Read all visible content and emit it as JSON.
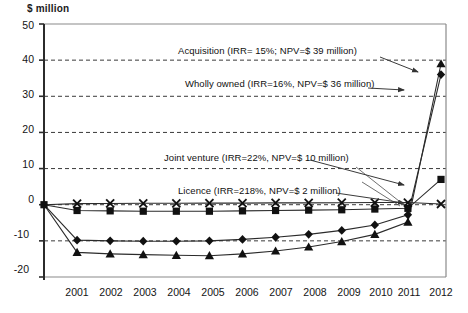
{
  "chart_data": {
    "type": "line",
    "title": "",
    "subtitle": "",
    "xlabel": "",
    "ylabel": "$ million",
    "ylim": [
      -20,
      50
    ],
    "xlim": [
      2000,
      2012
    ],
    "grid": true,
    "gridlines_y": [
      40,
      30,
      20,
      10,
      0,
      -10
    ],
    "legend_position": "inline-annotations",
    "ytick_labels": [
      "50",
      "40",
      "30",
      "20",
      "10",
      "0",
      "-10",
      "-20"
    ],
    "ytick_values": [
      50,
      40,
      30,
      20,
      10,
      0,
      -10,
      -20
    ],
    "xtick_labels": [
      "2001",
      "2002",
      "2003",
      "2004",
      "2005",
      "2006",
      "2007",
      "2008",
      "2009",
      "2010",
      "2011",
      "2012"
    ],
    "x": [
      2000,
      2001,
      2002,
      2003,
      2004,
      2005,
      2006,
      2007,
      2008,
      2009,
      2010,
      2011,
      2012
    ],
    "series": [
      {
        "name": "Acquisition",
        "marker": "triangle",
        "irr": "15%",
        "npv": "$ 39 million",
        "values": [
          0,
          -13.2,
          -13.6,
          -13.8,
          -14.0,
          -14.1,
          -13.6,
          -12.8,
          -11.7,
          -10.2,
          -8.2,
          -4.8,
          39
        ]
      },
      {
        "name": "Wholly owned",
        "marker": "diamond",
        "irr": "16%",
        "npv": "$ 36 million",
        "values": [
          0,
          -9.8,
          -10.0,
          -10.1,
          -10.1,
          -10.0,
          -9.6,
          -9.0,
          -8.2,
          -7.1,
          -5.6,
          -2.8,
          36
        ]
      },
      {
        "name": "Joint venture",
        "marker": "square",
        "irr": "22%",
        "npv": "$ 10 million",
        "values": [
          0,
          -1.6,
          -1.7,
          -1.8,
          -1.8,
          -1.8,
          -1.7,
          -1.6,
          -1.5,
          -1.4,
          -1.2,
          -1.0,
          7
        ]
      },
      {
        "name": "Licence",
        "marker": "cross",
        "irr": "218%",
        "npv": "$ 2 million",
        "values": [
          0,
          0.3,
          0.35,
          0.4,
          0.4,
          0.45,
          0.45,
          0.5,
          0.5,
          0.55,
          0.6,
          0.6,
          0.2
        ]
      }
    ],
    "annotations": [
      {
        "id": "acquisition",
        "text": "Acquisition (IRR= 15%; NPV=$ 39 million)"
      },
      {
        "id": "wholly-owned",
        "text": "Wholly owned (IRR=16%, NPV=$ 36 million)"
      },
      {
        "id": "joint-venture",
        "text": "Joint venture (IRR=22%, NPV=$ 10 million)"
      },
      {
        "id": "licence",
        "text": "Licence  (IRR=218%, NPV=$ 2 million)"
      }
    ],
    "colors": {
      "line": "#2b2b2b",
      "marker": "#111111",
      "grid": "#3a3a3a",
      "axis": "#2b2b2b",
      "background": "#ffffff"
    }
  }
}
